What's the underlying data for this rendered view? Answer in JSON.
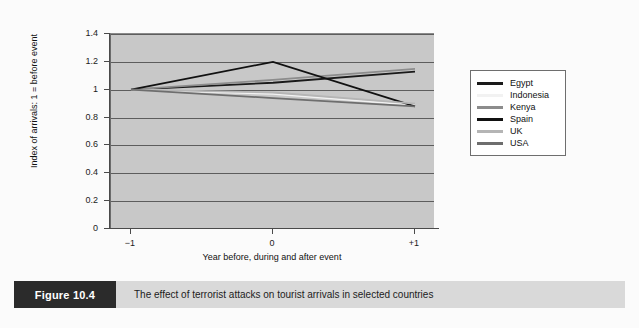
{
  "caption": {
    "tag": "Figure 10.4",
    "text": "The effect of terrorist attacks on tourist arrivals in selected countries"
  },
  "legend": {
    "position": "right",
    "entries": [
      {
        "label": "Egypt",
        "color": "#1a1a1a"
      },
      {
        "label": "Indonesia",
        "color": "#f2f2f2"
      },
      {
        "label": "Kenya",
        "color": "#8c8c8c"
      },
      {
        "label": "Spain",
        "color": "#111111"
      },
      {
        "label": "UK",
        "color": "#b5b5b5"
      },
      {
        "label": "USA",
        "color": "#6e6e6e"
      }
    ]
  },
  "chart_data": {
    "type": "line",
    "title": "",
    "xlabel": "Year before, during and after event",
    "ylabel": "Index of arrivals: 1 = before event",
    "x": [
      -1,
      0,
      1
    ],
    "x_tick_labels": [
      "−1",
      "0",
      "+1"
    ],
    "ylim": [
      0,
      1.4
    ],
    "y_ticks": [
      0,
      0.2,
      0.4,
      0.6,
      0.8,
      1,
      1.2,
      1.4
    ],
    "y_tick_labels": [
      "0",
      "0.2",
      "0.4",
      "0.6",
      "0.8",
      "1",
      "1.2",
      "1.4"
    ],
    "grid": true,
    "plot_background": "#c8c8c8",
    "series": [
      {
        "name": "Egypt",
        "color": "#1a1a1a",
        "values": [
          1.0,
          1.05,
          1.13
        ]
      },
      {
        "name": "Indonesia",
        "color": "#f2f2f2",
        "values": [
          1.0,
          0.97,
          0.89
        ]
      },
      {
        "name": "Kenya",
        "color": "#8c8c8c",
        "values": [
          1.0,
          1.07,
          1.15
        ]
      },
      {
        "name": "Spain",
        "color": "#111111",
        "values": [
          1.0,
          1.2,
          0.88
        ]
      },
      {
        "name": "UK",
        "color": "#b5b5b5",
        "values": [
          1.0,
          0.98,
          0.9
        ]
      },
      {
        "name": "USA",
        "color": "#6e6e6e",
        "values": [
          1.0,
          0.94,
          0.88
        ]
      }
    ]
  }
}
